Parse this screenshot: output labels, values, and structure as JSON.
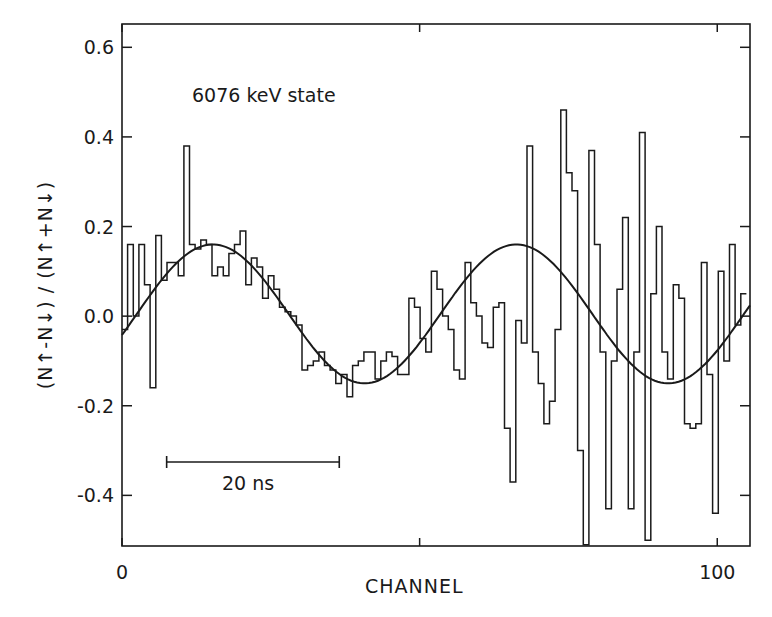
{
  "chart_data": {
    "type": "line",
    "title": "",
    "annotation": "6076 keV state",
    "scale_bar_label": "20 ns",
    "scale_bar_channels": [
      7.5,
      36.5
    ],
    "xlabel": "CHANNEL",
    "ylabel": "(N↑-N↓) / (N↑+N↓)",
    "xlim": [
      0,
      105.5
    ],
    "ylim": [
      -0.513,
      0.652
    ],
    "x_ticks": [
      0,
      50,
      100
    ],
    "x_tick_labels": [
      "0",
      "",
      "100"
    ],
    "y_ticks": [
      0.6,
      0.4,
      0.2,
      0.0,
      -0.2,
      -0.4
    ],
    "y_tick_labels": [
      "0.6",
      "0.4",
      "0.2",
      "0.0",
      "-0.2",
      "-0.4"
    ],
    "grid": false,
    "legend": null,
    "series": [
      {
        "name": "measured asymmetry (histogram)",
        "style": "step",
        "bin_start": 0,
        "bin_width": 1,
        "values": [
          -0.03,
          0.16,
          0.0,
          0.16,
          0.07,
          -0.16,
          0.18,
          0.08,
          0.12,
          0.12,
          0.09,
          0.38,
          0.16,
          0.15,
          0.17,
          0.16,
          0.09,
          0.11,
          0.09,
          0.14,
          0.16,
          0.19,
          0.07,
          0.13,
          0.11,
          0.04,
          0.09,
          0.06,
          0.02,
          0.01,
          0.0,
          -0.02,
          -0.12,
          -0.11,
          -0.1,
          -0.08,
          -0.11,
          -0.12,
          -0.15,
          -0.13,
          -0.18,
          -0.11,
          -0.1,
          -0.08,
          -0.08,
          -0.14,
          -0.1,
          -0.08,
          -0.09,
          -0.13,
          -0.13,
          0.04,
          0.02,
          -0.05,
          -0.08,
          0.1,
          0.06,
          0.0,
          -0.03,
          -0.12,
          -0.14,
          0.12,
          0.03,
          0.0,
          -0.06,
          -0.07,
          0.02,
          0.03,
          -0.25,
          -0.37,
          -0.01,
          -0.06,
          0.38,
          -0.08,
          -0.15,
          -0.24,
          -0.19,
          -0.03,
          0.46,
          0.32,
          0.28,
          -0.3,
          -0.51,
          0.37,
          0.16,
          -0.08,
          -0.43,
          -0.1,
          0.06,
          0.22,
          -0.43,
          -0.08,
          0.41,
          -0.5,
          0.05,
          0.2,
          -0.08,
          -0.14,
          0.07,
          0.04,
          -0.24,
          -0.25,
          -0.24,
          0.12,
          -0.13,
          -0.44,
          0.1,
          -0.1,
          0.16,
          -0.02,
          0.05
        ],
        "color": "#1a1a1a"
      },
      {
        "name": "fit",
        "style": "smooth",
        "function": "0.155*sin(2*pi*(ch-2.5)/51)+0.005",
        "x": [
          0,
          5,
          10,
          15,
          20,
          25,
          30,
          35,
          40,
          45,
          50,
          55,
          60,
          65,
          70,
          75,
          80,
          85,
          90,
          95,
          100,
          105
        ],
        "y": [
          -0.043,
          0.053,
          0.13,
          0.16,
          0.133,
          0.064,
          -0.029,
          -0.11,
          -0.149,
          -0.135,
          -0.074,
          0.018,
          0.103,
          0.154,
          0.152,
          0.097,
          0.012,
          -0.076,
          -0.138,
          -0.15,
          -0.109,
          -0.028
        ],
        "color": "#1a1a1a"
      }
    ]
  },
  "colors": {
    "ink": "#1a1a1a",
    "background": "#ffffff"
  }
}
